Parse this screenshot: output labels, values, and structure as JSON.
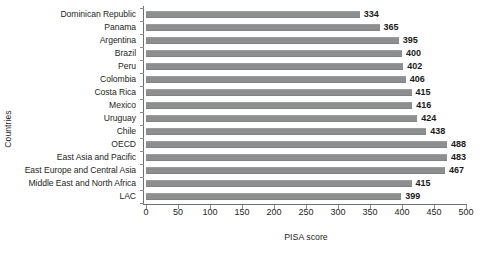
{
  "chart_data": {
    "type": "bar",
    "orientation": "horizontal",
    "title": "",
    "xlabel": "PISA score",
    "ylabel": "Countries",
    "xlim": [
      0,
      500
    ],
    "xticks": [
      0,
      50,
      100,
      150,
      200,
      250,
      300,
      350,
      400,
      450,
      500
    ],
    "grid": false,
    "legend": null,
    "bar_color": "#8c8e90",
    "categories": [
      "Dominican Republic",
      "Panama",
      "Argentina",
      "Brazil",
      "Peru",
      "Colombia",
      "Costa Rica",
      "Mexico",
      "Uruguay",
      "Chile",
      "OECD",
      "East Asia and Pacific",
      "East Europe and Central Asia",
      "Middle East and North Africa",
      "LAC"
    ],
    "values": [
      334,
      365,
      395,
      400,
      402,
      406,
      415,
      416,
      424,
      438,
      488,
      483,
      467,
      415,
      399
    ],
    "value_labels": [
      "334",
      "365",
      "395",
      "400",
      "402",
      "406",
      "415",
      "416",
      "424",
      "438",
      "488",
      "483",
      "467",
      "415",
      "399"
    ],
    "xtick_labels": [
      "0",
      "50",
      "100",
      "150",
      "200",
      "250",
      "300",
      "350",
      "400",
      "450",
      "500"
    ]
  }
}
